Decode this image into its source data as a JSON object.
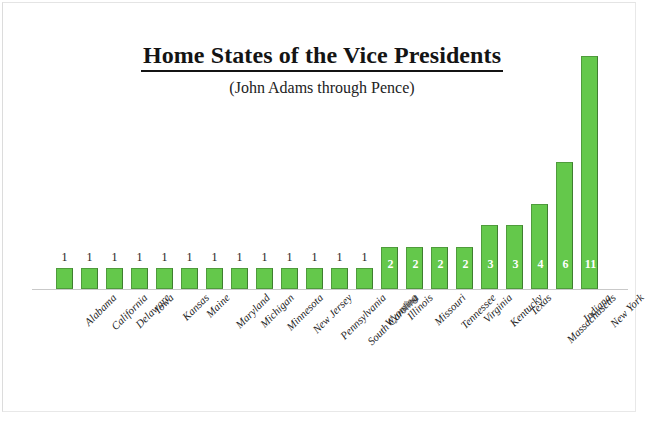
{
  "chart_data": {
    "type": "bar",
    "title": "Home States of the Vice Presidents",
    "subtitle": "(John Adams through Pence)",
    "xlabel": "",
    "ylabel": "",
    "ylim": [
      0,
      11
    ],
    "grid": false,
    "legend": false,
    "orientation": "vertical",
    "bar_color": "#64C84B",
    "bar_border_color": "#4F9C3C",
    "value_label_inside_color": "#FFFFFF",
    "value_label_above_color": "#1A1A1A",
    "categories": [
      "Alabama",
      "California",
      "Delaware",
      "Iowa",
      "Kansas",
      "Maine",
      "Maryland",
      "Michigan",
      "Minnesota",
      "New Jersey",
      "Pennsylvania",
      "South Carolina",
      "Wyoming",
      "Illinois",
      "Missouri",
      "Tennessee",
      "Virginia",
      "Kentucky",
      "Texas",
      "Massachusetts",
      "Indiana",
      "New York"
    ],
    "values": [
      1,
      1,
      1,
      1,
      1,
      1,
      1,
      1,
      1,
      1,
      1,
      1,
      1,
      2,
      2,
      2,
      2,
      3,
      3,
      4,
      6,
      11
    ],
    "value_labels": [
      "1",
      "1",
      "1",
      "1",
      "1",
      "1",
      "1",
      "1",
      "1",
      "1",
      "1",
      "1",
      "1",
      "2",
      "2",
      "2",
      "2",
      "3",
      "3",
      "4",
      "6",
      "11"
    ]
  }
}
